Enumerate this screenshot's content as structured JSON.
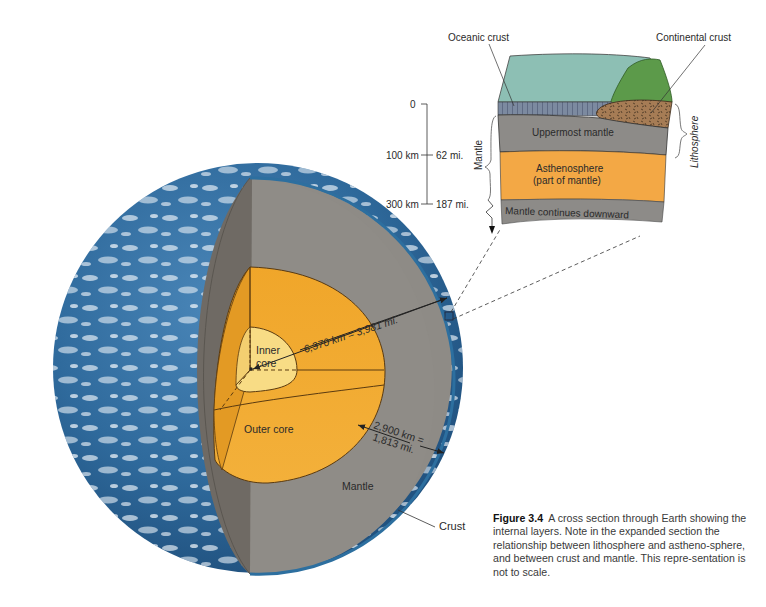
{
  "figure": {
    "number_label": "Figure 3.4",
    "caption_text": "A cross section through Earth showing the internal layers. Note in the expanded section the relationship between lithosphere and astheno-sphere, and between crust and mantle. This repre-sentation is not to scale."
  },
  "earth_labels": {
    "inner_core": [
      "Inner",
      "core"
    ],
    "outer_core": "Outer core",
    "mantle": "Mantle",
    "crust": "Crust",
    "radius": "6,370 km = 3,981 mi.",
    "mantle_thickness": [
      "2,900 km =",
      "1,813 mi."
    ]
  },
  "inset": {
    "oceanic_crust": "Oceanic crust",
    "continental_crust": "Continental crust",
    "uppermost_mantle": "Uppermost mantle",
    "asthenosphere": [
      "Asthenosphere",
      "(part of mantle)"
    ],
    "mantle_continues": "Mantle continues downward",
    "lithosphere": "Lithosphere",
    "mantle_brace": "Mantle"
  },
  "depth_scale": {
    "ticks": [
      {
        "km": "0",
        "mi": ""
      },
      {
        "km": "100 km",
        "mi": "62 mi."
      },
      {
        "km": "300 km",
        "mi": "187 mi."
      }
    ]
  },
  "colors": {
    "ocean_blue": "#2f6a9c",
    "mantle_gray": "#8e8b86",
    "mantle_dark": "#6f6a64",
    "outer_core": "#f2aa2c",
    "inner_core": "#f8dc85",
    "asthenosphere": "#f3a845",
    "sea": "#8dbfb4",
    "continent_green": "#5c9a4a",
    "continental_crust": "#a67c55"
  }
}
